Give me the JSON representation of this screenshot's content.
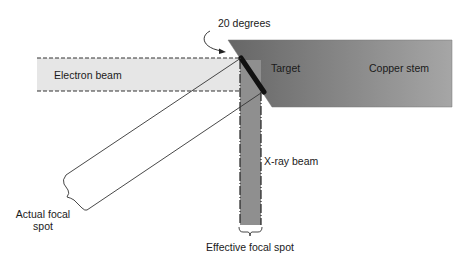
{
  "diagram": {
    "labels": {
      "angle": "20 degrees",
      "electron_beam": "Electron beam",
      "target": "Target",
      "copper_stem": "Copper stem",
      "xray_beam": "X-ray beam",
      "actual_focal_spot_line1": "Actual focal",
      "actual_focal_spot_line2": "spot",
      "effective_focal_spot": "Effective focal spot"
    },
    "colors": {
      "electron_beam_fill": "#e6e6e6",
      "copper_stem_dark": "#6e6e6e",
      "copper_stem_light": "#a3a3a3",
      "target": "#111111",
      "xray_beam_fill": "#8f8f8f",
      "line": "#333333"
    },
    "target_angle_degrees": 20
  }
}
